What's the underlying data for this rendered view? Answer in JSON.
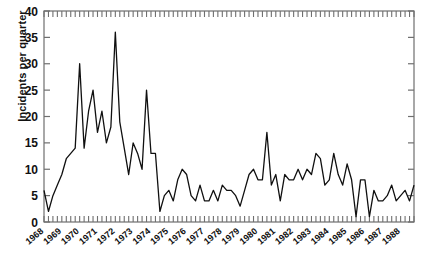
{
  "chart_data": {
    "type": "line",
    "title": "",
    "xlabel": "",
    "ylabel": "Incidents per quarter",
    "ylim": [
      0,
      40
    ],
    "yticks": [
      0,
      5,
      10,
      15,
      20,
      25,
      30,
      35,
      40
    ],
    "grid": false,
    "legend": null,
    "x_tick_interval": "quarterly",
    "x_label_interval": "yearly",
    "line_color": "#101010",
    "categories": [
      "1968 Q1",
      "1968 Q2",
      "1968 Q3",
      "1968 Q4",
      "1969 Q1",
      "1969 Q2",
      "1969 Q3",
      "1969 Q4",
      "1970 Q1",
      "1970 Q2",
      "1970 Q3",
      "1970 Q4",
      "1971 Q1",
      "1971 Q2",
      "1971 Q3",
      "1971 Q4",
      "1972 Q1",
      "1972 Q2",
      "1972 Q3",
      "1972 Q4",
      "1973 Q1",
      "1973 Q2",
      "1973 Q3",
      "1973 Q4",
      "1974 Q1",
      "1974 Q2",
      "1974 Q3",
      "1974 Q4",
      "1975 Q1",
      "1975 Q2",
      "1975 Q3",
      "1975 Q4",
      "1976 Q1",
      "1976 Q2",
      "1976 Q3",
      "1976 Q4",
      "1977 Q1",
      "1977 Q2",
      "1977 Q3",
      "1977 Q4",
      "1978 Q1",
      "1978 Q2",
      "1978 Q3",
      "1978 Q4",
      "1979 Q1",
      "1979 Q2",
      "1979 Q3",
      "1979 Q4",
      "1980 Q1",
      "1980 Q2",
      "1980 Q3",
      "1980 Q4",
      "1981 Q1",
      "1981 Q2",
      "1981 Q3",
      "1981 Q4",
      "1982 Q1",
      "1982 Q2",
      "1982 Q3",
      "1982 Q4",
      "1983 Q1",
      "1983 Q2",
      "1983 Q3",
      "1983 Q4",
      "1984 Q1",
      "1984 Q2",
      "1984 Q3",
      "1984 Q4",
      "1985 Q1",
      "1985 Q2",
      "1985 Q3",
      "1985 Q4",
      "1986 Q1",
      "1986 Q2",
      "1986 Q3",
      "1986 Q4",
      "1987 Q1",
      "1987 Q2",
      "1987 Q3",
      "1987 Q4",
      "1988 Q1",
      "1988 Q2",
      "1988 Q3",
      "1988 Q4"
    ],
    "year_labels": [
      "1968",
      "1969",
      "1970",
      "1971",
      "1972",
      "1973",
      "1974",
      "1975",
      "1976",
      "1977",
      "1978",
      "1979",
      "1980",
      "1981",
      "1982",
      "1983",
      "1984",
      "1985",
      "1986",
      "1987",
      "1988"
    ],
    "values": [
      6,
      2,
      5,
      7,
      9,
      12,
      13,
      14,
      30,
      14,
      21,
      25,
      17,
      21,
      15,
      18,
      36,
      19,
      14,
      9,
      15,
      13,
      10,
      25,
      13,
      13,
      2,
      5,
      6,
      4,
      8,
      10,
      9,
      5,
      4,
      7,
      4,
      4,
      6,
      4,
      7,
      6,
      6,
      5,
      3,
      6,
      9,
      10,
      8,
      8,
      17,
      7,
      9,
      4,
      9,
      8,
      8,
      10,
      8,
      10,
      9,
      13,
      12,
      7,
      8,
      13,
      9,
      7,
      11,
      8,
      1,
      8,
      8,
      1,
      6,
      4,
      4,
      5,
      7,
      4,
      5,
      6,
      4,
      7
    ]
  }
}
